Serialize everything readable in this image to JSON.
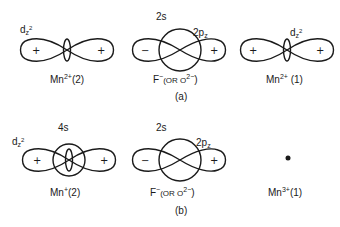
{
  "figure": {
    "panels": [
      {
        "id": "a",
        "caption": "(a)",
        "items": [
          {
            "name": "Mn2+(2)",
            "label_main": "Mn",
            "label_sup": "2+",
            "label_suffix": "(2)",
            "orbitals": [
              {
                "type": "dz2",
                "label": "d",
                "label_sub": "z",
                "label_sup": "2"
              }
            ],
            "signs": [
              "+",
              "+"
            ]
          },
          {
            "name": "F-",
            "label_main": "F",
            "label_sup": "−",
            "label_suffix": "(OR O",
            "label_sup2": "2−",
            "label_end": ")",
            "orbitals": [
              {
                "type": "s",
                "label": "2s"
              },
              {
                "type": "pz",
                "label": "2p",
                "label_sub": "z"
              }
            ],
            "signs": [
              "−",
              "+"
            ]
          },
          {
            "name": "Mn2+(1)",
            "label_main": "Mn",
            "label_sup": "2+",
            "label_suffix": " (1)",
            "orbitals": [
              {
                "type": "dz2",
                "label": "d",
                "label_sub": "z",
                "label_sup": "2"
              }
            ],
            "signs": [
              "+",
              "+"
            ]
          }
        ]
      },
      {
        "id": "b",
        "caption": "(b)",
        "items": [
          {
            "name": "Mn+(2)",
            "label_main": "Mn",
            "label_sup": "+",
            "label_suffix": "(2)",
            "orbitals": [
              {
                "type": "dz2",
                "label": "d",
                "label_sub": "z",
                "label_sup": "2"
              },
              {
                "type": "s",
                "label": "4s"
              }
            ],
            "signs": [
              "+",
              "+"
            ]
          },
          {
            "name": "F-",
            "label_main": "F",
            "label_sup": "−",
            "label_suffix": "(OR O",
            "label_sup2": "2−",
            "label_end": ")",
            "orbitals": [
              {
                "type": "s",
                "label": "2s"
              },
              {
                "type": "pz",
                "label": "2p",
                "label_sub": "z"
              }
            ],
            "signs": [
              "−",
              "+"
            ]
          },
          {
            "name": "Mn3+(1)",
            "label_main": "Mn",
            "label_sup": "3+",
            "label_suffix": "(1)",
            "orbitals": [
              {
                "type": "point",
                "label": ""
              }
            ],
            "signs": []
          }
        ]
      }
    ]
  }
}
